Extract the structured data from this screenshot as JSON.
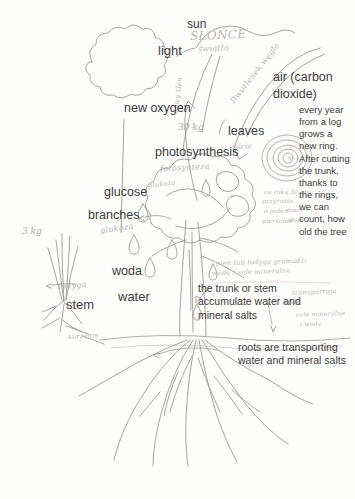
{
  "page": {
    "background_color": "#fdfdfc",
    "ink_color": "#8e8a86",
    "text_color": "#3b3b3b",
    "handwriting_color": "#b9b5b0"
  },
  "labels": {
    "sun": "sun",
    "light": "light",
    "air": "air (carbon\ndioxide)",
    "air_line1": "air (carbon",
    "air_line2": "dioxide)",
    "new_oxygen": "new oxygen",
    "leaves": "leaves",
    "photosynthesis": "photosynthesis",
    "glucose": "glucose",
    "branches": "branches",
    "woda": "woda",
    "water": "water",
    "stem": "stem",
    "mass_30kg": "30 kg",
    "mass_3kg": "3 kg"
  },
  "handwriting": {
    "sun_pl": "SŁOŃCE",
    "light_pl": "światło",
    "carbon_dioxide_pl": "Dwutlenek węgla",
    "new_oxygen_pl": "nowy tlen",
    "leaves_pl": "liście",
    "photosynthesis_pl": "fotosynteza",
    "glucose_pl_top": "glukoza",
    "glucose_pl": "glukoza",
    "stem_pl": "łodyga",
    "roots_pl": "korzenie",
    "trunk_note_line1": "pień lub łodyga gromadzi",
    "trunk_note_line2": "wodę i sole mineralne",
    "rings_note_line1": "co roku",
    "rings_note_line2": "przyrasta",
    "rings_note_line3": "o jeden",
    "rings_note_line4": "pierścień",
    "rings_note_line5": "30 pni",
    "rings_note_line6": "nowy",
    "rings_note_line7": "słoje",
    "roots_note_line1": "transportują",
    "roots_note_line2": "wodę",
    "roots_note_line3": "sole mineralne",
    "roots_note_line4": "i wodę"
  },
  "paragraphs": {
    "rings_text": "every year from a log grows a new ring. After cutting the trunk, thanks to the rings, we can count, how old the tree",
    "trunk_text": "the trunk or stem accumulate water and mineral salts",
    "roots_text": "roots are transporting water and mineral salts"
  }
}
